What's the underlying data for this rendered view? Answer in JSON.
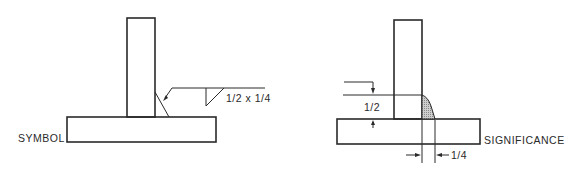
{
  "diagram": {
    "symbol_view": {
      "caption": "SYMBOL",
      "weld_size_label": "1/2 x 1/4"
    },
    "significance_view": {
      "caption": "SIGNIFICANCE",
      "vertical_leg_label": "1/2",
      "horizontal_leg_label": "1/4"
    },
    "colors": {
      "line": "#2a2a2a",
      "weld_fill": "#bfbfbf",
      "background": "#ffffff"
    }
  }
}
